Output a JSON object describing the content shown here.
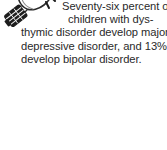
{
  "callout": {
    "kind": "did-you-know-tip",
    "icon_name": "light-bulb-icon",
    "background_color": "#ffffff",
    "text_color": "#2a2a2a",
    "full_text": "Seventy-six percent of children with dysthymic disorder develop major depressive disorder, and 13% develop bipolar disorder.",
    "lines": [
      "Seventy-six percent of",
      "children with dys-",
      "thymic disorder develop major",
      "depressive disorder, and 13%",
      "develop bipolar disorder."
    ],
    "statistics": [
      "Seventy-six percent",
      "13%"
    ]
  }
}
